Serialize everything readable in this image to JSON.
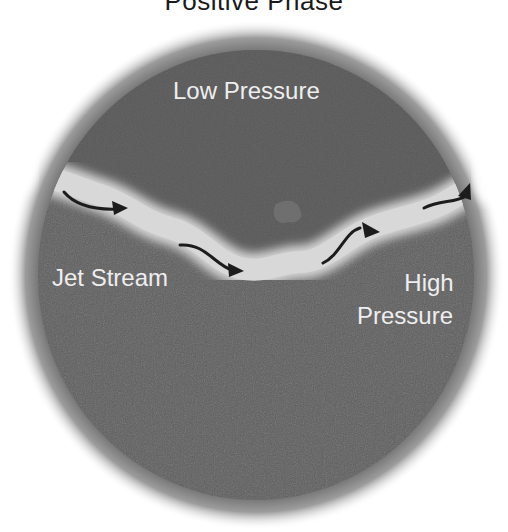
{
  "diagram": {
    "title": "Positive Phase",
    "regions": {
      "low": "Low Pressure",
      "high_line1": "High",
      "high_line2": "Pressure"
    },
    "jet_label": "Jet Stream",
    "arrows": [
      {
        "name": "flow-arrow-1",
        "direction": "east"
      },
      {
        "name": "flow-arrow-2",
        "direction": "southeast"
      },
      {
        "name": "flow-arrow-3",
        "direction": "northeast"
      },
      {
        "name": "flow-arrow-4",
        "direction": "northeast"
      }
    ],
    "colors": {
      "globe": "#5f5f5f",
      "globe_halo": "#9a9a9a",
      "jet_stream": "#d6d6d6",
      "arrow": "#1c1c1c",
      "label_text": "#eeeeee"
    }
  }
}
